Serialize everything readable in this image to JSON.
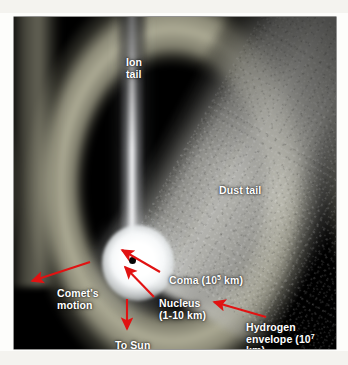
{
  "figure": {
    "type": "annotated-photograph",
    "background_color": "#000000",
    "page_color": "#fdfdfb",
    "annotation_color": "#e11212",
    "label_color": "#ffffff"
  },
  "labels": {
    "ion_tail": "Ion\ntail",
    "dust_tail": "Dust tail",
    "coma_prefix": "Coma (10",
    "coma_exponent": "5",
    "coma_suffix": " km)",
    "nucleus_line1": "Nucleus",
    "nucleus_line2": "(1-10 km)",
    "comets_motion": "Comet's\nmotion",
    "to_sun": "To Sun",
    "hydrogen_line1": "Hydrogen",
    "hydrogen_prefix": "envelope (10",
    "hydrogen_exponent": "7",
    "hydrogen_suffix": " km)"
  },
  "features": [
    {
      "name": "ion-tail",
      "label": "Ion tail",
      "size": ""
    },
    {
      "name": "dust-tail",
      "label": "Dust tail",
      "size": ""
    },
    {
      "name": "coma",
      "label": "Coma",
      "size": "10^5 km"
    },
    {
      "name": "nucleus",
      "label": "Nucleus",
      "size": "1-10 km"
    },
    {
      "name": "hydrogen-envelope",
      "label": "Hydrogen envelope",
      "size": "10^7 km"
    }
  ],
  "directions": [
    {
      "name": "comets-motion",
      "label": "Comet's motion",
      "points": "lower-left"
    },
    {
      "name": "to-sun",
      "label": "To Sun",
      "points": "down"
    }
  ]
}
